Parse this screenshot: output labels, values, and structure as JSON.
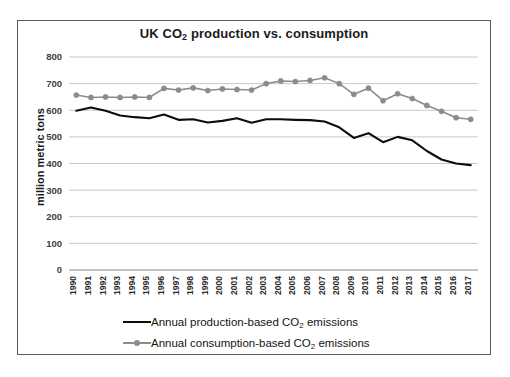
{
  "chart_data": {
    "type": "line",
    "title": "UK CO2 production vs. consumption",
    "title_parts": {
      "pre": "UK CO",
      "sub": "2",
      "post": " production vs. consumption"
    },
    "xlabel": "",
    "ylabel": "million metric tons",
    "ylim": [
      0,
      800
    ],
    "ytick_step": 100,
    "yticks": [
      "0",
      "100",
      "200",
      "300",
      "400",
      "500",
      "600",
      "700",
      "800"
    ],
    "grid": true,
    "legend_position": "bottom",
    "categories": [
      "1990",
      "1991",
      "1992",
      "1993",
      "1994",
      "1995",
      "1996",
      "1997",
      "1998",
      "1999",
      "2000",
      "2001",
      "2002",
      "2003",
      "2004",
      "2005",
      "2006",
      "2007",
      "2008",
      "2009",
      "2010",
      "2011",
      "2012",
      "2013",
      "2014",
      "2015",
      "2016",
      "2017"
    ],
    "series": [
      {
        "name": "Annual production-based CO2 emissions",
        "name_parts": {
          "pre": "Annual production-based CO",
          "sub": "2",
          "post": " emissions"
        },
        "color": "#0d0d0d",
        "marker": "none",
        "values": [
          598,
          610,
          598,
          580,
          574,
          570,
          584,
          564,
          566,
          554,
          560,
          570,
          553,
          566,
          566,
          564,
          563,
          558,
          536,
          496,
          514,
          480,
          500,
          487,
          447,
          415,
          400,
          394
        ]
      },
      {
        "name": "Annual consumption-based CO2 emissions",
        "name_parts": {
          "pre": "Annual consumption-based CO",
          "sub": "2",
          "post": " emissions"
        },
        "color": "#8c8c8c",
        "marker": "circle",
        "values": [
          657,
          648,
          650,
          648,
          650,
          648,
          682,
          676,
          684,
          674,
          680,
          678,
          676,
          700,
          710,
          708,
          712,
          722,
          700,
          660,
          683,
          636,
          662,
          644,
          618,
          596,
          572,
          566
        ]
      }
    ]
  },
  "axes": {
    "ytick_labels": [
      "800",
      "700",
      "600",
      "500",
      "400",
      "300",
      "200",
      "100",
      "0"
    ]
  }
}
